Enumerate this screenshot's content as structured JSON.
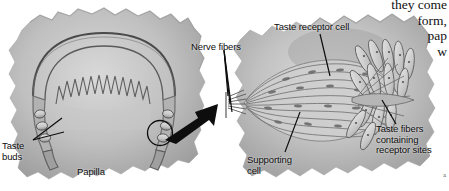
{
  "figure": {
    "kind": "anatomical-illustration",
    "width": 449,
    "height": 191,
    "background_color": "#ffffff",
    "ink_color": "#0d0d0d",
    "tissue_fill": "#b9b9b9",
    "tissue_shadow": "#8d8d8d",
    "tissue_light": "#d6d6d6"
  },
  "labels": {
    "taste_buds": "Taste\nbuds",
    "papilla": "Papilla",
    "nerve_fibers": "Nerve fibers",
    "taste_receptor_cell": "Taste receptor cell",
    "supporting_cell": "Supporting\ncell",
    "taste_fibers": "Taste fibers\ncontaining\nreceptor sites"
  },
  "body_text": {
    "clipped_column": "they come\nform,\npap\nw"
  },
  "corner": {
    "mark": "a"
  }
}
